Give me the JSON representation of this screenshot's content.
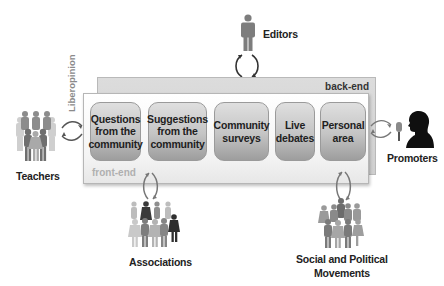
{
  "diagram": {
    "platform_name": "Liberopinion",
    "layers": {
      "back_end": "back-end",
      "front_end": "front-end"
    },
    "modules": [
      {
        "label": "Questions from the community"
      },
      {
        "label": "Suggestions from the community"
      },
      {
        "label": "Community surveys"
      },
      {
        "label": "Live debates"
      },
      {
        "label": "Personal area"
      }
    ],
    "actors": {
      "editors": "Editors",
      "teachers": "Teachers",
      "promoters": "Promoters",
      "associations": "Associations",
      "movements_line1": "Social and Political",
      "movements_line2": "Movements"
    },
    "colors": {
      "module_fill_top": "#dfdfdf",
      "module_fill_bottom": "#9d9d9d",
      "back_end_fill": "#d5d5d5",
      "front_end_fill": "#f7f7f7",
      "label_gray": "#b0b0b0",
      "text": "#222222"
    }
  }
}
